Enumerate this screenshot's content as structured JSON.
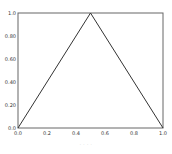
{
  "chart_data": {
    "type": "line",
    "title": "",
    "xlabel": "",
    "ylabel": "",
    "xlim": [
      0.0,
      1.0
    ],
    "ylim": [
      0.0,
      1.0
    ],
    "grid": false,
    "legend": null,
    "x_ticks": [
      "0.0",
      "0.2",
      "0.4",
      "0.6",
      "0.8",
      "1.0"
    ],
    "y_ticks": [
      "0.0",
      "0.20",
      "0.40",
      "0.60",
      "0.80",
      "1.0"
    ],
    "series": [
      {
        "name": "",
        "color": "#333333",
        "x": [
          0.0,
          0.5,
          1.0
        ],
        "y": [
          0.0,
          1.0,
          0.0
        ]
      }
    ]
  },
  "caption": "· · · ·"
}
